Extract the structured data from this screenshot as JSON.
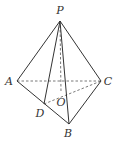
{
  "figure": {
    "type": "tetrahedron",
    "points": {
      "P": {
        "label": "P",
        "x": 60,
        "y": 21,
        "lx": 60,
        "ly": 14
      },
      "A": {
        "label": "A",
        "x": 17,
        "y": 81,
        "lx": 9,
        "ly": 85
      },
      "B": {
        "label": "B",
        "x": 69,
        "y": 124,
        "lx": 68,
        "ly": 137
      },
      "C": {
        "label": "C",
        "x": 101,
        "y": 81,
        "lx": 108,
        "ly": 85
      },
      "D": {
        "label": "D",
        "x": 44,
        "y": 104,
        "lx": 40,
        "ly": 117
      },
      "O": {
        "label": "O",
        "x": 61,
        "y": 92,
        "lx": 61,
        "ly": 106
      }
    },
    "solid_edges": [
      "PA",
      "PB",
      "PC",
      "PD",
      "AB",
      "BC"
    ],
    "dashed_edges": [
      "AC",
      "DC",
      "PO"
    ]
  }
}
